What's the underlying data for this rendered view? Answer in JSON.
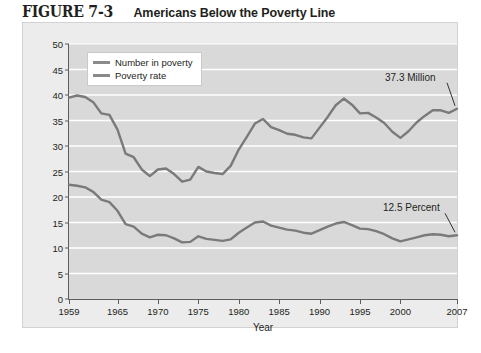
{
  "figure": {
    "number": "FIGURE 7-3",
    "title": "Americans Below the Poverty Line"
  },
  "colors": {
    "line": "#7a7a7a",
    "axis": "#5d5d5d",
    "plot_background": "#d9d9d9",
    "card_background": "#ececec",
    "gridline": "#ffffff",
    "text": "#231f20"
  },
  "legend": {
    "position": "top-left-inside",
    "items": [
      {
        "label": "Number in poverty"
      },
      {
        "label": "Poverty rate"
      }
    ]
  },
  "annotations": [
    {
      "text": "37.3 Million",
      "series": "Number in poverty",
      "year": 2007,
      "value": 37.3
    },
    {
      "text": "12.5 Percent",
      "series": "Poverty rate",
      "year": 2007,
      "value": 12.5
    }
  ],
  "chart_data": {
    "type": "line",
    "title": "Americans Below the Poverty Line",
    "xlabel": "Year",
    "ylabel": "Numbers in millions, rates in percent",
    "xlim": [
      1959,
      2007
    ],
    "ylim": [
      0,
      50
    ],
    "yticks": [
      0,
      5,
      10,
      15,
      20,
      25,
      30,
      35,
      40,
      45,
      50
    ],
    "xticks": [
      1959,
      1965,
      1970,
      1975,
      1980,
      1985,
      1990,
      1995,
      2000,
      2007
    ],
    "grid": true,
    "grid_axis": "y",
    "legend_position": "upper left",
    "x": [
      1959,
      1960,
      1961,
      1962,
      1963,
      1964,
      1965,
      1966,
      1967,
      1968,
      1969,
      1970,
      1971,
      1972,
      1973,
      1974,
      1975,
      1976,
      1977,
      1978,
      1979,
      1980,
      1981,
      1982,
      1983,
      1984,
      1985,
      1986,
      1987,
      1988,
      1989,
      1990,
      1991,
      1992,
      1993,
      1994,
      1995,
      1996,
      1997,
      1998,
      1999,
      2000,
      2001,
      2002,
      2003,
      2004,
      2005,
      2006,
      2007
    ],
    "series": [
      {
        "name": "Number in poverty",
        "unit": "millions",
        "values": [
          39.5,
          39.9,
          39.6,
          38.6,
          36.4,
          36.1,
          33.2,
          28.5,
          27.8,
          25.4,
          24.1,
          25.4,
          25.6,
          24.5,
          23.0,
          23.4,
          25.9,
          25.0,
          24.7,
          24.5,
          26.1,
          29.3,
          31.8,
          34.4,
          35.3,
          33.7,
          33.1,
          32.4,
          32.2,
          31.7,
          31.5,
          33.6,
          35.7,
          38.0,
          39.3,
          38.1,
          36.4,
          36.5,
          35.6,
          34.5,
          32.8,
          31.6,
          32.9,
          34.6,
          35.9,
          37.0,
          37.0,
          36.5,
          37.3
        ]
      },
      {
        "name": "Poverty rate",
        "unit": "percent",
        "values": [
          22.4,
          22.2,
          21.9,
          21.0,
          19.5,
          19.0,
          17.3,
          14.7,
          14.2,
          12.8,
          12.1,
          12.6,
          12.5,
          11.9,
          11.1,
          11.2,
          12.3,
          11.8,
          11.6,
          11.4,
          11.7,
          13.0,
          14.0,
          15.0,
          15.2,
          14.4,
          14.0,
          13.6,
          13.4,
          13.0,
          12.8,
          13.5,
          14.2,
          14.8,
          15.1,
          14.5,
          13.8,
          13.7,
          13.3,
          12.7,
          11.9,
          11.3,
          11.7,
          12.1,
          12.5,
          12.7,
          12.6,
          12.3,
          12.5
        ]
      }
    ]
  }
}
